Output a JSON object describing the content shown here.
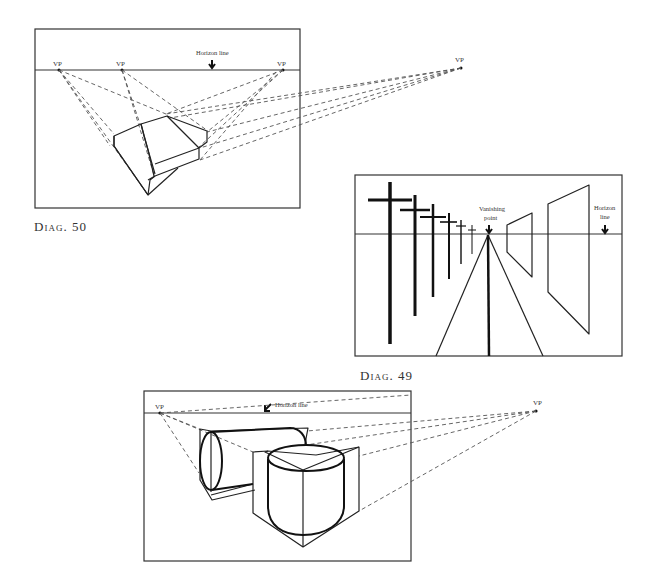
{
  "diagrams": [
    {
      "id": "diag-50",
      "caption": "Diag. 50",
      "subject": "Three-point perspective of an angled box (two overlapping slabs)",
      "horizon_label": "Horizon line",
      "vp_labels": [
        "VP",
        "VP",
        "VP",
        "VP"
      ]
    },
    {
      "id": "diag-49",
      "caption": "Diag. 49",
      "subject": "One-point perspective: telegraph poles, road and signboards receding to a vanishing point",
      "vanishing_point_label_line1": "Vanishing",
      "vanishing_point_label_line2": "point",
      "horizon_label_line1": "Horizon",
      "horizon_label_line2": "line"
    },
    {
      "id": "diag-bottom",
      "caption": "",
      "subject": "Two-point perspective: cylinders constructed inside boxes",
      "horizon_label": "Horizon line",
      "vp_labels": [
        "VP",
        "VP"
      ]
    }
  ],
  "colors": {
    "ink": "#222222",
    "paper": "#ffffff",
    "construction": "#555555"
  }
}
